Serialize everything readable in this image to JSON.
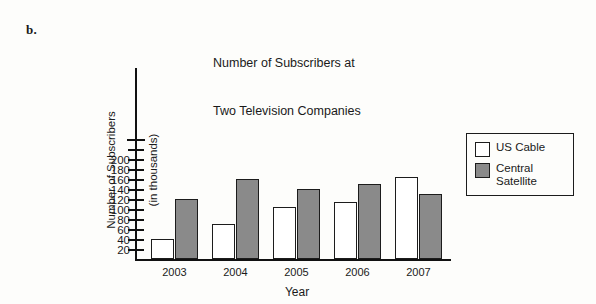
{
  "problem_letter": "b.",
  "chart_data": {
    "type": "bar",
    "title": "Number of Subscribers at\nTwo Television Companies",
    "title_line1": "Number of Subscribers at",
    "title_line2": "Two Television Companies",
    "xlabel": "Year",
    "ylabel": "Number of Subscribers\n(in thousands)",
    "ylabel_line1": "Number of Subscribers",
    "ylabel_line2": "(in thousands)",
    "categories": [
      "2003",
      "2004",
      "2005",
      "2006",
      "2007"
    ],
    "series": [
      {
        "name": "US Cable",
        "color": "#ffffff",
        "values": [
          40,
          70,
          105,
          115,
          165
        ]
      },
      {
        "name": "Central Satellite",
        "color": "#8a8a8a",
        "values": [
          120,
          160,
          140,
          150,
          130
        ]
      }
    ],
    "legend": [
      {
        "label": "US Cable",
        "color": "#ffffff"
      },
      {
        "label": "Central\nSatellite",
        "color": "#8a8a8a"
      }
    ],
    "legend_position": "right",
    "ylim": [
      0,
      220
    ],
    "yticks": [
      20,
      40,
      60,
      80,
      100,
      120,
      140,
      160,
      180,
      200
    ],
    "ytick_labels": [
      "20",
      "40",
      "60",
      "80",
      "100",
      "120",
      "140",
      "160",
      "180",
      "200"
    ],
    "extra_ticks_above_last_label": 2,
    "grid": false,
    "axis_color": "#111111"
  }
}
